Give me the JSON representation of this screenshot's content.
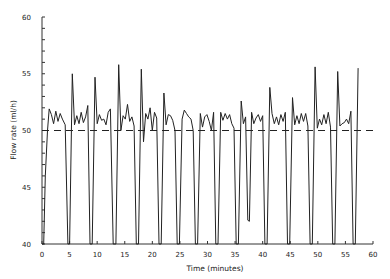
{
  "chart_data": {
    "type": "line",
    "title": "",
    "xlabel": "Time (minutes)",
    "ylabel": "Flow rate (ml/h)",
    "xlim": [
      0,
      60
    ],
    "ylim": [
      40,
      60
    ],
    "x_ticks": [
      0,
      5,
      10,
      15,
      20,
      25,
      30,
      35,
      40,
      45,
      50,
      55,
      60
    ],
    "y_ticks": [
      40,
      45,
      50,
      55,
      60
    ],
    "grid": false,
    "legend": null,
    "series": [
      {
        "name": "Measured flow rate",
        "style": "solid",
        "points": [
          [
            0.0,
            40.0
          ],
          [
            0.3,
            40.0
          ],
          [
            0.6,
            46.0
          ],
          [
            1.0,
            50.0
          ],
          [
            1.3,
            51.9
          ],
          [
            1.7,
            51.4
          ],
          [
            2.1,
            50.6
          ],
          [
            2.5,
            51.7
          ],
          [
            2.9,
            50.8
          ],
          [
            3.3,
            51.5
          ],
          [
            3.7,
            51.0
          ],
          [
            4.2,
            50.5
          ],
          [
            4.7,
            40.0
          ],
          [
            5.0,
            40.0
          ],
          [
            5.5,
            55.0
          ],
          [
            5.9,
            50.5
          ],
          [
            6.3,
            51.3
          ],
          [
            6.7,
            50.6
          ],
          [
            7.1,
            51.6
          ],
          [
            7.5,
            50.7
          ],
          [
            7.9,
            51.2
          ],
          [
            8.3,
            52.2
          ],
          [
            8.7,
            40.0
          ],
          [
            9.1,
            40.0
          ],
          [
            9.6,
            54.7
          ],
          [
            10.0,
            50.6
          ],
          [
            10.4,
            51.4
          ],
          [
            10.8,
            50.9
          ],
          [
            11.2,
            51.0
          ],
          [
            11.6,
            50.5
          ],
          [
            12.0,
            51.6
          ],
          [
            12.4,
            51.9
          ],
          [
            12.9,
            40.0
          ],
          [
            13.4,
            40.0
          ],
          [
            13.9,
            55.8
          ],
          [
            14.3,
            50.0
          ],
          [
            14.7,
            51.3
          ],
          [
            15.1,
            51.0
          ],
          [
            15.5,
            52.3
          ],
          [
            15.9,
            50.8
          ],
          [
            16.3,
            51.2
          ],
          [
            16.7,
            50.4
          ],
          [
            17.1,
            40.0
          ],
          [
            17.5,
            40.0
          ],
          [
            18.0,
            55.4
          ],
          [
            18.4,
            49.0
          ],
          [
            18.8,
            51.5
          ],
          [
            19.2,
            51.0
          ],
          [
            19.6,
            52.0
          ],
          [
            20.0,
            50.0
          ],
          [
            20.4,
            51.6
          ],
          [
            20.8,
            51.1
          ],
          [
            21.2,
            40.0
          ],
          [
            21.6,
            40.0
          ],
          [
            22.1,
            53.3
          ],
          [
            22.5,
            50.5
          ],
          [
            22.9,
            51.4
          ],
          [
            23.3,
            51.3
          ],
          [
            23.7,
            50.9
          ],
          [
            24.1,
            50.0
          ],
          [
            24.5,
            40.0
          ],
          [
            24.9,
            40.0
          ],
          [
            25.4,
            51.0
          ],
          [
            25.8,
            51.8
          ],
          [
            26.2,
            51.5
          ],
          [
            26.6,
            51.2
          ],
          [
            27.0,
            51.0
          ],
          [
            27.4,
            50.0
          ],
          [
            27.8,
            40.0
          ],
          [
            28.2,
            40.0
          ],
          [
            28.7,
            51.5
          ],
          [
            29.1,
            50.3
          ],
          [
            29.5,
            51.2
          ],
          [
            29.9,
            51.4
          ],
          [
            30.3,
            50.8
          ],
          [
            30.7,
            50.0
          ],
          [
            31.1,
            51.6
          ],
          [
            31.5,
            40.0
          ],
          [
            31.9,
            40.0
          ],
          [
            32.4,
            51.6
          ],
          [
            32.8,
            50.9
          ],
          [
            33.2,
            51.5
          ],
          [
            33.6,
            51.0
          ],
          [
            34.0,
            51.4
          ],
          [
            34.4,
            50.6
          ],
          [
            34.8,
            50.2
          ],
          [
            35.2,
            40.0
          ],
          [
            35.6,
            40.0
          ],
          [
            36.1,
            52.6
          ],
          [
            36.5,
            50.6
          ],
          [
            36.9,
            51.2
          ],
          [
            37.3,
            42.1
          ],
          [
            37.6,
            42.0
          ],
          [
            38.0,
            51.6
          ],
          [
            38.4,
            50.6
          ],
          [
            38.8,
            51.1
          ],
          [
            39.2,
            51.4
          ],
          [
            39.6,
            50.8
          ],
          [
            40.0,
            51.3
          ],
          [
            40.4,
            40.0
          ],
          [
            40.8,
            40.0
          ],
          [
            41.3,
            53.8
          ],
          [
            41.7,
            51.5
          ],
          [
            42.1,
            50.6
          ],
          [
            42.5,
            51.2
          ],
          [
            42.9,
            50.5
          ],
          [
            43.3,
            51.4
          ],
          [
            43.7,
            50.8
          ],
          [
            44.1,
            51.6
          ],
          [
            44.5,
            40.0
          ],
          [
            44.9,
            40.0
          ],
          [
            45.4,
            52.9
          ],
          [
            45.8,
            50.5
          ],
          [
            46.2,
            51.3
          ],
          [
            46.6,
            50.6
          ],
          [
            47.0,
            51.5
          ],
          [
            47.4,
            50.8
          ],
          [
            47.8,
            51.5
          ],
          [
            48.2,
            50.4
          ],
          [
            48.6,
            40.0
          ],
          [
            49.0,
            40.0
          ],
          [
            49.5,
            55.6
          ],
          [
            49.9,
            50.2
          ],
          [
            50.3,
            51.0
          ],
          [
            50.7,
            50.5
          ],
          [
            51.1,
            51.4
          ],
          [
            51.5,
            50.6
          ],
          [
            51.9,
            51.6
          ],
          [
            52.3,
            50.3
          ],
          [
            52.7,
            40.0
          ],
          [
            53.1,
            40.0
          ],
          [
            53.6,
            55.2
          ],
          [
            54.0,
            50.4
          ],
          [
            54.4,
            50.6
          ],
          [
            54.8,
            50.7
          ],
          [
            55.2,
            51.0
          ],
          [
            55.6,
            50.6
          ],
          [
            56.0,
            51.7
          ],
          [
            56.4,
            40.0
          ],
          [
            56.8,
            40.0
          ],
          [
            57.3,
            55.5
          ]
        ]
      },
      {
        "name": "Target flow rate",
        "style": "dashed",
        "points": [
          [
            0,
            50
          ],
          [
            60,
            50
          ]
        ]
      }
    ]
  },
  "axes": {
    "xlabel": "Time (minutes)",
    "ylabel": "Flow rate (ml/h)"
  }
}
